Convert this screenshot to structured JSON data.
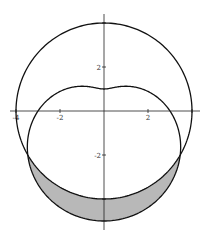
{
  "chart_data": {
    "type": "line",
    "title": "",
    "xlabel": "",
    "ylabel": "",
    "xlim": [
      -4.5,
      4.5
    ],
    "ylim": [
      -5.3,
      4.9
    ],
    "grid": false,
    "series": [
      {
        "name": "circle",
        "equation": "r = 4",
        "color": "#111111"
      },
      {
        "name": "limacon",
        "equation": "r = 3 - 2 sin(theta)",
        "color": "#111111"
      }
    ],
    "shaded_region": {
      "description": "inside limacon r = 3 - 2 sin(theta), outside circle r = 4",
      "theta_range_deg": [
        210,
        330
      ],
      "intersection_points": [
        [
          -3.46,
          -2
        ],
        [
          3.46,
          -2
        ]
      ],
      "fill": "#b8b8b8"
    },
    "x_ticks": [
      {
        "value": -4,
        "label": "-4"
      },
      {
        "value": -2,
        "label": "-2"
      },
      {
        "value": 2,
        "label": "2"
      },
      {
        "value": 4,
        "label": "4"
      }
    ],
    "y_ticks": [
      {
        "value": 4,
        "label": "4"
      },
      {
        "value": 2,
        "label": "2"
      },
      {
        "value": -2,
        "label": "-2"
      },
      {
        "value": -4,
        "label": "-4"
      }
    ]
  },
  "layout": {
    "origin_px": [
      104,
      111
    ],
    "scale_px_per_unit": 22,
    "colors": {
      "curve": "#111111",
      "axis": "#222222",
      "shade": "#b8b8b8",
      "background": "#ffffff"
    }
  }
}
